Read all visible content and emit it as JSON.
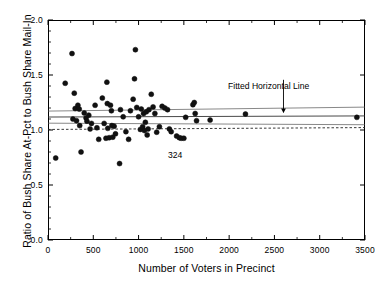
{
  "chart_data": {
    "type": "scatter",
    "title": "",
    "xlabel": "Number of Voters in Precinct",
    "ylabel": "Ratio of Bush Share At-Pct to Bush Share Mail-In",
    "xlim": [
      0,
      3500
    ],
    "ylim": [
      0.0,
      2.0
    ],
    "xticks": [
      0,
      500,
      1000,
      1500,
      2000,
      2500,
      3000,
      3500
    ],
    "xtick_labels": [
      "0",
      "500",
      "1000",
      "1500",
      "2000",
      "2500",
      "3000",
      "3500"
    ],
    "yticks": [
      0.0,
      0.5,
      1.0,
      1.5,
      2.0
    ],
    "ytick_labels": [
      "0.0",
      "0.5",
      "1.0",
      "1.5",
      "2.0"
    ],
    "x_minor_tick_step": 250,
    "y_minor_tick_step": 0.1,
    "grid": false,
    "legend": "none",
    "marker": {
      "shape": "circle",
      "color": "#111111",
      "size_px": 5
    },
    "points": [
      {
        "x": 85,
        "y": 0.745
      },
      {
        "x": 190,
        "y": 1.425
      },
      {
        "x": 265,
        "y": 1.695
      },
      {
        "x": 275,
        "y": 1.1
      },
      {
        "x": 290,
        "y": 1.335
      },
      {
        "x": 300,
        "y": 1.195
      },
      {
        "x": 315,
        "y": 1.085
      },
      {
        "x": 330,
        "y": 1.225
      },
      {
        "x": 345,
        "y": 1.19
      },
      {
        "x": 350,
        "y": 1.04
      },
      {
        "x": 365,
        "y": 0.8
      },
      {
        "x": 400,
        "y": 1.155
      },
      {
        "x": 420,
        "y": 1.11
      },
      {
        "x": 430,
        "y": 1.08
      },
      {
        "x": 450,
        "y": 1.135
      },
      {
        "x": 465,
        "y": 1.01
      },
      {
        "x": 480,
        "y": 1.06
      },
      {
        "x": 520,
        "y": 1.225
      },
      {
        "x": 540,
        "y": 1.02
      },
      {
        "x": 560,
        "y": 0.915
      },
      {
        "x": 600,
        "y": 1.29
      },
      {
        "x": 620,
        "y": 1.06
      },
      {
        "x": 640,
        "y": 0.925
      },
      {
        "x": 650,
        "y": 1.435
      },
      {
        "x": 655,
        "y": 1.24
      },
      {
        "x": 660,
        "y": 1.015
      },
      {
        "x": 675,
        "y": 0.93
      },
      {
        "x": 690,
        "y": 1.225
      },
      {
        "x": 700,
        "y": 1.175
      },
      {
        "x": 705,
        "y": 1.04
      },
      {
        "x": 715,
        "y": 0.935
      },
      {
        "x": 730,
        "y": 1.035
      },
      {
        "x": 745,
        "y": 0.965
      },
      {
        "x": 790,
        "y": 0.695
      },
      {
        "x": 800,
        "y": 1.185
      },
      {
        "x": 830,
        "y": 1.12
      },
      {
        "x": 860,
        "y": 0.985
      },
      {
        "x": 890,
        "y": 0.915
      },
      {
        "x": 910,
        "y": 1.175
      },
      {
        "x": 940,
        "y": 1.28
      },
      {
        "x": 955,
        "y": 1.465
      },
      {
        "x": 965,
        "y": 1.73
      },
      {
        "x": 980,
        "y": 1.205
      },
      {
        "x": 1000,
        "y": 1.12
      },
      {
        "x": 1020,
        "y": 1.005
      },
      {
        "x": 1030,
        "y": 1.19
      },
      {
        "x": 1045,
        "y": 1.03
      },
      {
        "x": 1055,
        "y": 1.15
      },
      {
        "x": 1065,
        "y": 0.995
      },
      {
        "x": 1075,
        "y": 1.07
      },
      {
        "x": 1085,
        "y": 1.165
      },
      {
        "x": 1095,
        "y": 0.955
      },
      {
        "x": 1105,
        "y": 1.01
      },
      {
        "x": 1115,
        "y": 1.185
      },
      {
        "x": 1140,
        "y": 1.325
      },
      {
        "x": 1160,
        "y": 1.21
      },
      {
        "x": 1180,
        "y": 1.15
      },
      {
        "x": 1200,
        "y": 0.98
      },
      {
        "x": 1230,
        "y": 1.03
      },
      {
        "x": 1260,
        "y": 1.215
      },
      {
        "x": 1290,
        "y": 1.2
      },
      {
        "x": 1320,
        "y": 1.185
      },
      {
        "x": 1340,
        "y": 1.01
      },
      {
        "x": 1360,
        "y": 0.985
      },
      {
        "x": 1420,
        "y": 0.945
      },
      {
        "x": 1450,
        "y": 0.93
      },
      {
        "x": 1470,
        "y": 0.925
      },
      {
        "x": 1500,
        "y": 0.925
      },
      {
        "x": 1520,
        "y": 1.115
      },
      {
        "x": 1600,
        "y": 1.23
      },
      {
        "x": 1615,
        "y": 1.25
      },
      {
        "x": 1625,
        "y": 1.15
      },
      {
        "x": 1640,
        "y": 1.085
      },
      {
        "x": 1790,
        "y": 1.09
      },
      {
        "x": 2180,
        "y": 1.145
      },
      {
        "x": 3410,
        "y": 1.115
      }
    ],
    "fitted_line": {
      "label": "Fitted Horizontal Line",
      "y_start": 1.118,
      "y_end": 1.128,
      "style": "solid",
      "color": "#333333"
    },
    "confidence_bands": [
      {
        "name": "upper",
        "y_start": 1.172,
        "y_end": 1.208,
        "style": "solid",
        "color": "#555555"
      },
      {
        "name": "lower",
        "y_start": 1.062,
        "y_end": 1.048,
        "style": "solid",
        "color": "#555555"
      }
    ],
    "reference_line": {
      "name": "unity-reference",
      "y_start": 1.005,
      "y_end": 1.022,
      "style": "dashed",
      "color": "#222222"
    },
    "annotations": [
      {
        "name": "fitted-line-annotation",
        "text": "Fitted Horizontal Line",
        "x": 2600,
        "y": 1.42,
        "arrow": true
      },
      {
        "name": "point-324-annotation",
        "text": "324",
        "x": 1450,
        "y": 0.84,
        "arrow": false
      }
    ]
  }
}
